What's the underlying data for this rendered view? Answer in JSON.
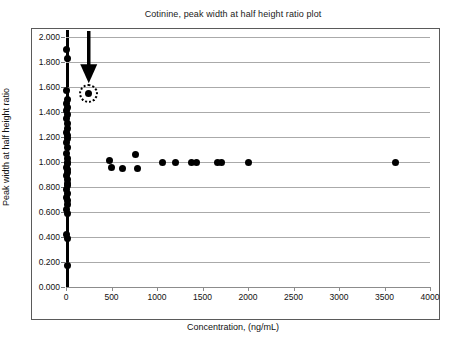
{
  "chart_data": {
    "type": "scatter",
    "title": "Cotinine, peak width at half height ratio plot",
    "xlabel": "Concentration, (ng/mL)",
    "ylabel": "Peak width at half height ratio",
    "xlim": [
      0,
      4000
    ],
    "ylim": [
      0.0,
      2.0
    ],
    "xticks": [
      "0",
      "500",
      "1000",
      "1500",
      "2000",
      "2500",
      "3000",
      "3500",
      "4000"
    ],
    "xtick_values": [
      0,
      500,
      1000,
      1500,
      2000,
      2500,
      3000,
      3500,
      4000
    ],
    "yticks": [
      "0.000",
      "0.200",
      "0.400",
      "0.600",
      "0.800",
      "1.000",
      "1.200",
      "1.400",
      "1.600",
      "1.800",
      "2.000"
    ],
    "ytick_values": [
      0.0,
      0.2,
      0.4,
      0.6,
      0.8,
      1.0,
      1.2,
      1.4,
      1.6,
      1.8,
      2.0
    ],
    "grid": "horizontal",
    "legend": "none",
    "marker": "filled-circle",
    "marker_color": "#000000",
    "points": [
      {
        "x": 10,
        "y": 1.9
      },
      {
        "x": 12,
        "y": 1.83
      },
      {
        "x": 8,
        "y": 1.57
      },
      {
        "x": 14,
        "y": 1.5
      },
      {
        "x": 10,
        "y": 1.47
      },
      {
        "x": 12,
        "y": 1.44
      },
      {
        "x": 9,
        "y": 1.41
      },
      {
        "x": 13,
        "y": 1.38
      },
      {
        "x": 10,
        "y": 1.35
      },
      {
        "x": 11,
        "y": 1.31
      },
      {
        "x": 14,
        "y": 1.27
      },
      {
        "x": 9,
        "y": 1.24
      },
      {
        "x": 12,
        "y": 1.21
      },
      {
        "x": 16,
        "y": 1.19
      },
      {
        "x": 10,
        "y": 1.16
      },
      {
        "x": 13,
        "y": 1.12
      },
      {
        "x": 9,
        "y": 1.07
      },
      {
        "x": 18,
        "y": 1.03
      },
      {
        "x": 11,
        "y": 1.0
      },
      {
        "x": 14,
        "y": 0.99
      },
      {
        "x": 10,
        "y": 0.96
      },
      {
        "x": 16,
        "y": 0.94
      },
      {
        "x": 12,
        "y": 0.92
      },
      {
        "x": 9,
        "y": 0.89
      },
      {
        "x": 13,
        "y": 0.86
      },
      {
        "x": 11,
        "y": 0.83
      },
      {
        "x": 15,
        "y": 0.81
      },
      {
        "x": 10,
        "y": 0.78
      },
      {
        "x": 12,
        "y": 0.75
      },
      {
        "x": 9,
        "y": 0.72
      },
      {
        "x": 13,
        "y": 0.69
      },
      {
        "x": 11,
        "y": 0.66
      },
      {
        "x": 10,
        "y": 0.62
      },
      {
        "x": 12,
        "y": 0.59
      },
      {
        "x": 10,
        "y": 0.42
      },
      {
        "x": 13,
        "y": 0.39
      },
      {
        "x": 11,
        "y": 0.17
      },
      {
        "x": 480,
        "y": 1.01
      },
      {
        "x": 500,
        "y": 0.96
      },
      {
        "x": 620,
        "y": 0.95
      },
      {
        "x": 760,
        "y": 1.06
      },
      {
        "x": 790,
        "y": 0.95
      },
      {
        "x": 1060,
        "y": 1.0
      },
      {
        "x": 1200,
        "y": 1.0
      },
      {
        "x": 1380,
        "y": 1.0
      },
      {
        "x": 1430,
        "y": 1.0
      },
      {
        "x": 1660,
        "y": 1.0
      },
      {
        "x": 1710,
        "y": 1.0
      },
      {
        "x": 2010,
        "y": 1.0
      },
      {
        "x": 3620,
        "y": 1.0
      }
    ],
    "annotation": {
      "type": "arrow-with-circle",
      "label": "outlier-highlight",
      "target_x": 250,
      "target_y": 1.55,
      "arrow_from_y": 2.0
    }
  }
}
